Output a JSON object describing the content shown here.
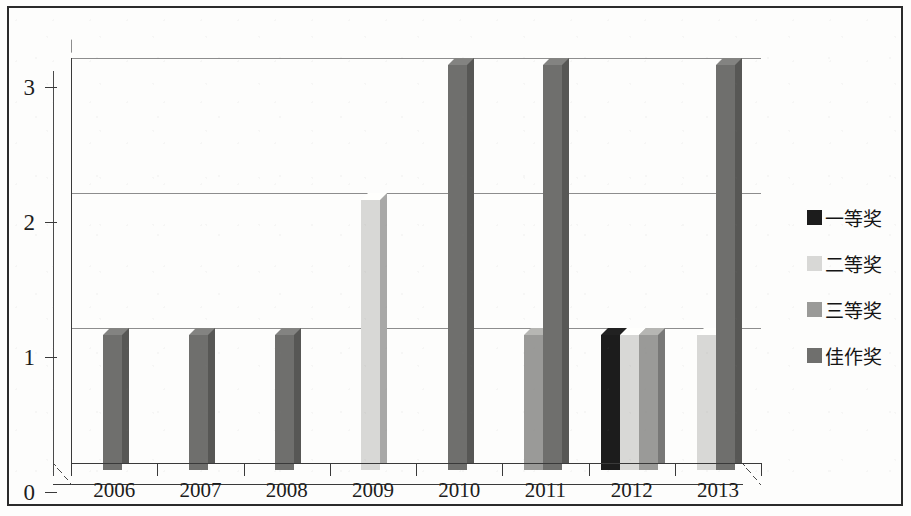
{
  "chart_data": {
    "type": "bar",
    "title": "",
    "xlabel": "",
    "ylabel": "",
    "categories": [
      "2006",
      "2007",
      "2008",
      "2009",
      "2010",
      "2011",
      "2012",
      "2013"
    ],
    "ylim": [
      0,
      3
    ],
    "yticks": [
      "0",
      "1",
      "2",
      "3"
    ],
    "grid": true,
    "legend_position": "right",
    "series": [
      {
        "name": "一等奖",
        "color": "#1c1c1c",
        "values": [
          0,
          0,
          0,
          0,
          0,
          0,
          1,
          0
        ]
      },
      {
        "name": "二等奖",
        "color": "#d8d8d6",
        "values": [
          0,
          0,
          0,
          2,
          0,
          0,
          1,
          1
        ]
      },
      {
        "name": "三等奖",
        "color": "#9a9a98",
        "values": [
          0,
          0,
          0,
          0,
          0,
          1,
          1,
          0
        ]
      },
      {
        "name": "佳作奖",
        "color": "#6f6f6d",
        "values": [
          1,
          1,
          1,
          0,
          3,
          3,
          0,
          3
        ]
      }
    ]
  },
  "yaxis": {
    "ticks": [
      {
        "label": "3",
        "value": 3
      },
      {
        "label": "2",
        "value": 2
      },
      {
        "label": "1",
        "value": 1
      },
      {
        "label": "0",
        "value": 0
      }
    ]
  },
  "xaxis": {
    "labels": [
      "2006",
      "2007",
      "2008",
      "2009",
      "2010",
      "2011",
      "2012",
      "2013"
    ]
  },
  "legend": {
    "items": [
      {
        "label": "一等奖",
        "color": "#1c1c1c"
      },
      {
        "label": "二等奖",
        "color": "#d8d8d6"
      },
      {
        "label": "三等奖",
        "color": "#9a9a98"
      },
      {
        "label": "佳作奖",
        "color": "#6f6f6d"
      }
    ]
  }
}
